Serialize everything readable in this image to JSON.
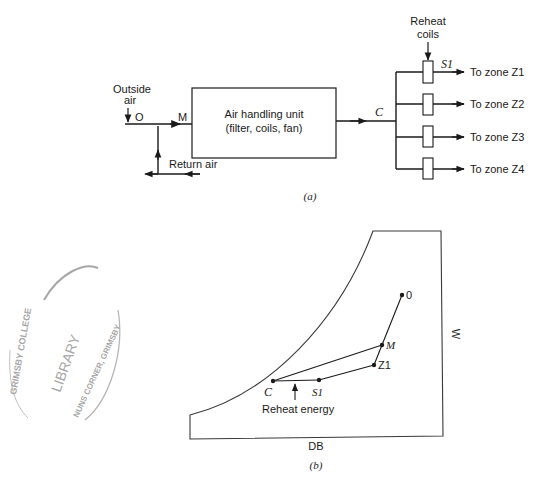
{
  "figure_a": {
    "caption": "(a)",
    "outside_air_label_line1": "Outside",
    "outside_air_label_line2": "air",
    "point_o": "O",
    "point_m": "M",
    "ahu_line1": "Air handling unit",
    "ahu_line2": "(filter, coils, fan)",
    "point_c": "C",
    "return_air_label": "Return air",
    "reheat_label_line1": "Reheat",
    "reheat_label_line2": "coils",
    "point_s1": "S1",
    "zones": [
      {
        "label": "To zone Z1"
      },
      {
        "label": "To zone Z2"
      },
      {
        "label": "To zone Z3"
      },
      {
        "label": "To zone Z4"
      }
    ]
  },
  "figure_b": {
    "caption": "(b)",
    "x_axis_label": "DB",
    "y_axis_label": "W",
    "points": {
      "o": "0",
      "m": "M",
      "z1": "Z1",
      "c": "C",
      "s1": "S1"
    },
    "reheat_energy_label": "Reheat energy"
  },
  "stamp": {
    "top_arc": "GRIMSBY COLLEGE",
    "center": "LIBRARY",
    "bottom_arc": "NUNS CORNER, GRIMSBY"
  }
}
